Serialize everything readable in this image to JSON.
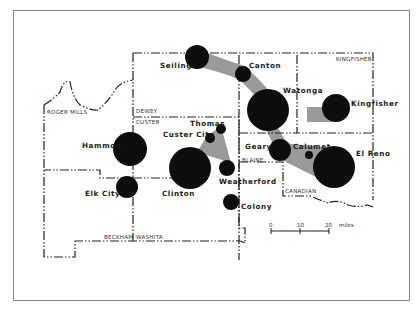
{
  "map": {
    "counties": [
      "ROGER MILLS",
      "DEWEY",
      "CUSTER",
      "BLAINE",
      "KINGFISHER",
      "CANADIAN",
      "BECKHAM",
      "WASHITA"
    ],
    "towns": [
      {
        "name": "Seiling",
        "x": 197,
        "y": 57,
        "r": 12
      },
      {
        "name": "Canton",
        "x": 243,
        "y": 74,
        "r": 8
      },
      {
        "name": "Watonga",
        "x": 268,
        "y": 110,
        "r": 21
      },
      {
        "name": "Kingfisher",
        "x": 336,
        "y": 108,
        "r": 14
      },
      {
        "name": "Hammon",
        "x": 130,
        "y": 149,
        "r": 17
      },
      {
        "name": "Thomas",
        "x": 221,
        "y": 129,
        "r": 5
      },
      {
        "name": "Custer City",
        "x": 210,
        "y": 138,
        "r": 5
      },
      {
        "name": "Clinton",
        "x": 190,
        "y": 168,
        "r": 21
      },
      {
        "name": "Weatherford",
        "x": 227,
        "y": 168,
        "r": 8
      },
      {
        "name": "Colony",
        "x": 231,
        "y": 202,
        "r": 8
      },
      {
        "name": "Elk City",
        "x": 127,
        "y": 187,
        "r": 11
      },
      {
        "name": "Geary",
        "x": 280,
        "y": 150,
        "r": 11
      },
      {
        "name": "Calumet",
        "x": 309,
        "y": 155,
        "r": 4
      },
      {
        "name": "El Reno",
        "x": 334,
        "y": 167,
        "r": 21
      }
    ],
    "scale": {
      "ticks": [
        "0",
        "10",
        "20"
      ],
      "unit": "miles"
    },
    "colors": {
      "circle": "#0d0d0d",
      "link": "#9a9a9a",
      "border": "#222222",
      "frame": "#888888"
    }
  }
}
